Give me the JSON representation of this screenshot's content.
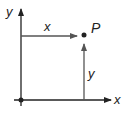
{
  "diagram": {
    "axis_labels": {
      "x": "x",
      "y": "y"
    },
    "point_label": "P",
    "horizontal_component_label": "x",
    "vertical_component_label": "y",
    "colors": {
      "axes": "#222222",
      "components": "#555555",
      "point": "#222222"
    }
  }
}
